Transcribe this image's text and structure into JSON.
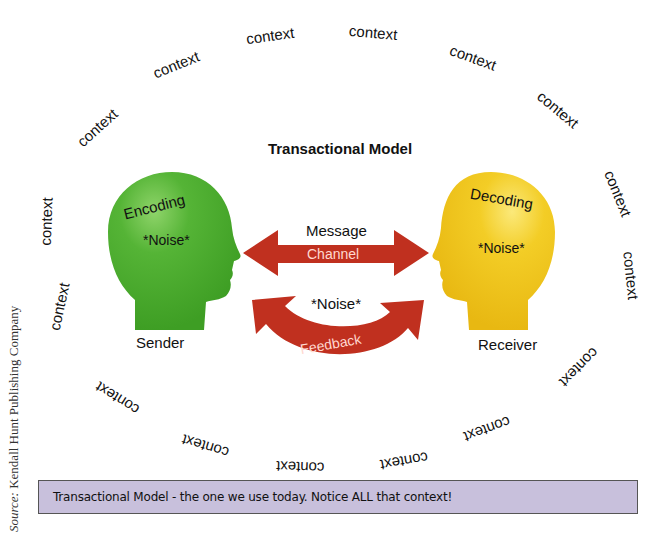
{
  "title": "Transactional Model",
  "source_credit": {
    "prefix": "Source:",
    "text": "Kendall Hunt Publishing Company"
  },
  "caption": "Transactional Model - the one we use today. Notice ALL that context!",
  "sender": {
    "label": "Sender",
    "process": "Encoding",
    "noise": "*Noise*",
    "color": "#4caf2e"
  },
  "receiver": {
    "label": "Receiver",
    "process": "Decoding",
    "noise": "*Noise*",
    "color": "#f2c81e"
  },
  "channel_arrow": {
    "above_label": "Message",
    "label": "Channel",
    "color": "#c0301f"
  },
  "feedback_arrow": {
    "above_label": "*Noise*",
    "label": "Feedback",
    "color": "#c0301f"
  },
  "context_labels": [
    "context",
    "context",
    "context",
    "context",
    "context",
    "context",
    "context",
    "context",
    "context",
    "context",
    "context",
    "context",
    "context",
    "context",
    "context",
    "context"
  ],
  "caption_bg_color": "#c8c0dc"
}
